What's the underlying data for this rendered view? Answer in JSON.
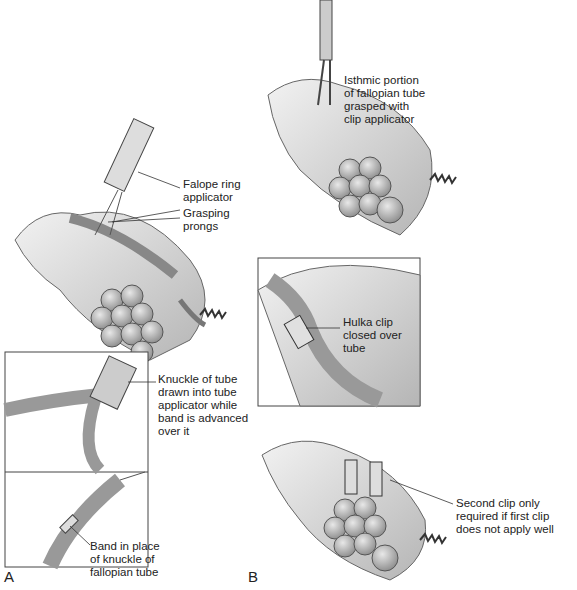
{
  "panels": {
    "a": "A",
    "b": "B"
  },
  "labels": {
    "falope": "Falope ring\napplicator",
    "prongs": "Grasping\nprongs",
    "knuckle": "Knuckle of tube\ndrawn into tube\napplicator while\nband is advanced\nover it",
    "band": "Band in place\nof knuckle of\nfallopian tube",
    "isthmic": "Isthmic portion\nof fallopian tube\ngrasped with\nclip applicator",
    "hulka": "Hulka clip\nclosed over\ntube",
    "second": "Second clip only\nrequired if first clip\ndoes not apply well"
  }
}
